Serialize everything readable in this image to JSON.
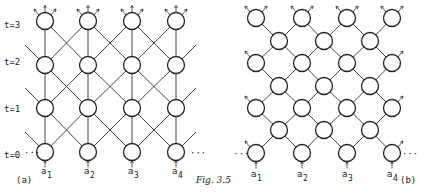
{
  "figure": {
    "caption": "Fig. 3.5",
    "ellipsis": "···",
    "panel_a": {
      "label": "(a)",
      "time_labels": [
        "t=0",
        "t=1",
        "t=2",
        "t=3"
      ],
      "input_labels": [
        {
          "base": "a",
          "sub": "1"
        },
        {
          "base": "a",
          "sub": "2"
        },
        {
          "base": "a",
          "sub": "3"
        },
        {
          "base": "a",
          "sub": "4"
        }
      ],
      "columns": 4,
      "rows": 4,
      "connectivity": "each node connects to the node above and its diagonal neighbours in the next time step"
    },
    "panel_b": {
      "label": "(b)",
      "input_labels": [
        {
          "base": "a",
          "sub": "1"
        },
        {
          "base": "a",
          "sub": "2"
        },
        {
          "base": "a",
          "sub": "3"
        },
        {
          "base": "a",
          "sub": "4"
        }
      ],
      "columns": 7,
      "connectivity": "staggered diagonal lattice; each node connects to diagonal neighbours"
    }
  }
}
